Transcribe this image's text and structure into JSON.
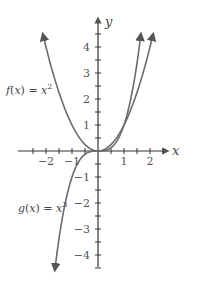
{
  "chart_data": {
    "type": "line",
    "title": "",
    "xlabel": "x",
    "ylabel": "y",
    "xlim": [
      -2.5,
      2.5
    ],
    "ylim": [
      -4.5,
      4.5
    ],
    "x_ticks": [
      -2,
      -1,
      1,
      2
    ],
    "y_ticks": [
      -4,
      -3,
      -2,
      -1,
      1,
      2,
      3,
      4
    ],
    "minor_tick_step": 0.5,
    "grid": false,
    "series": [
      {
        "name": "f(x) = x^2",
        "label_prefix": "f(x) = x",
        "label_exp": "2",
        "x": [
          -2.1,
          -2,
          -1.5,
          -1,
          -0.5,
          0,
          0.5,
          1,
          1.5,
          2,
          2.1
        ],
        "y": [
          4.41,
          4,
          2.25,
          1,
          0.25,
          0,
          0.25,
          1,
          2.25,
          4,
          4.41
        ]
      },
      {
        "name": "g(x) = x^3",
        "label_prefix": "g(x) = x",
        "label_exp": "3",
        "x": [
          -1.65,
          -1.5,
          -1,
          -0.5,
          0,
          0.5,
          1,
          1.5,
          1.64
        ],
        "y": [
          -4.49,
          -3.375,
          -1,
          -0.125,
          0,
          0.125,
          1,
          3.375,
          4.41
        ]
      }
    ]
  }
}
